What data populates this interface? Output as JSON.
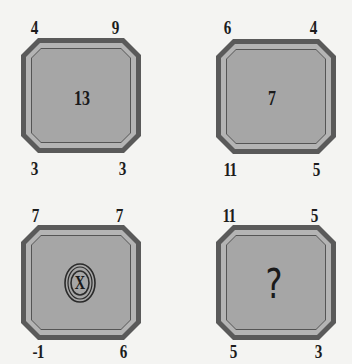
{
  "puzzle": {
    "cards": [
      {
        "position": "top-left",
        "corners": {
          "top_left": "4",
          "top_right": "9",
          "bottom_left": "3",
          "bottom_right": "3"
        },
        "center": "13"
      },
      {
        "position": "top-right",
        "corners": {
          "top_left": "6",
          "top_right": "4",
          "bottom_left": "11",
          "bottom_right": "5"
        },
        "center": "7"
      },
      {
        "position": "bottom-left",
        "corners": {
          "top_left": "7",
          "top_right": "7",
          "bottom_left": "-1",
          "bottom_right": "6"
        },
        "center": "X"
      },
      {
        "position": "bottom-right",
        "corners": {
          "top_left": "11",
          "top_right": "5",
          "bottom_left": "5",
          "bottom_right": "3"
        },
        "center": "?"
      }
    ],
    "colors": {
      "background": "#f4f4f2",
      "outer_border": "#5a5a5a",
      "inner_band": "#b4b4b4",
      "fill": "#a6a6a6",
      "text": "#1a1a1a"
    }
  }
}
